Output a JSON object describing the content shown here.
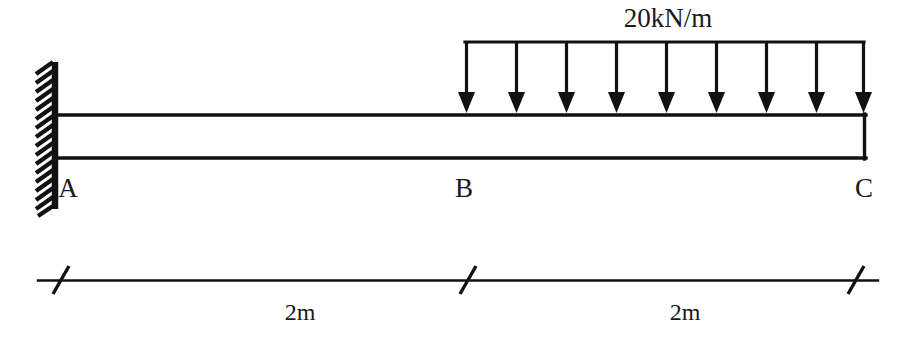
{
  "figure": {
    "kind": "cantilever-beam-free-body-diagram",
    "background_color": "#ffffff",
    "ink_color": "#111111",
    "width": 913,
    "height": 340
  },
  "load": {
    "label": "20kN/m",
    "type": "uniformly-distributed-load",
    "magnitude": 20,
    "unit": "kN/m",
    "direction": "downward",
    "arrow_count": 9,
    "span_from": "B",
    "span_to": "C"
  },
  "nodes": [
    {
      "id": "A",
      "label": "A",
      "support": "fixed",
      "x": 68
    },
    {
      "id": "B",
      "label": "B",
      "support": "none",
      "x": 462
    },
    {
      "id": "C",
      "label": "C",
      "support": "free-end",
      "x": 862
    }
  ],
  "dimensions": [
    {
      "label": "2m",
      "value": 2,
      "unit": "m",
      "from": "A",
      "to": "B"
    },
    {
      "label": "2m",
      "value": 2,
      "unit": "m",
      "from": "B",
      "to": "C"
    }
  ],
  "geometry": {
    "wall": {
      "x_face": 55,
      "x_hatch_left": 33,
      "y_top": 62,
      "y_bottom": 208,
      "hatch_count": 17
    },
    "beam": {
      "x_left": 55,
      "x_right": 866,
      "y_top": 115,
      "y_bottom": 158
    },
    "load_rail": {
      "x_left": 465,
      "x_right": 864,
      "y": 42
    },
    "arrow_tip_y": 113,
    "arrow_xs": [
      465,
      515,
      565,
      615,
      665,
      715,
      765,
      815,
      864
    ],
    "node_label_y": 196,
    "load_label": {
      "x": 668,
      "y": 26
    },
    "dimension_line": {
      "y": 280,
      "x_left": 38,
      "x_right": 878
    },
    "dimension_ticks": [
      60,
      467,
      855
    ],
    "dimension_label_y": 315,
    "dimension_label_xs": [
      300,
      685
    ]
  }
}
